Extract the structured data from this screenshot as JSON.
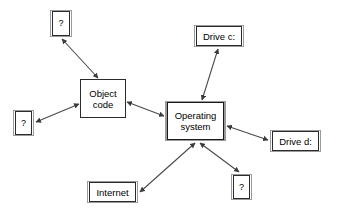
{
  "diagram": {
    "type": "concept-map",
    "background_color": "#ffffff",
    "line_color": "#4a4a4a",
    "box_border_color": "#2b2b2b",
    "box_frame_color": "#9b9b9b",
    "nodes": [
      {
        "id": "q_top",
        "label": "?",
        "style": "framed",
        "x": 50,
        "y": 10,
        "w": 22,
        "h": 27
      },
      {
        "id": "drive_c",
        "label": "Drive c:",
        "style": "framed",
        "x": 194,
        "y": 25,
        "w": 50,
        "h": 22
      },
      {
        "id": "object",
        "label": "Object\ncode",
        "style": "plain",
        "x": 80,
        "y": 79,
        "w": 46,
        "h": 39
      },
      {
        "id": "q_left",
        "label": "?",
        "style": "framed",
        "x": 13,
        "y": 110,
        "w": 21,
        "h": 26
      },
      {
        "id": "os",
        "label": "Operating\nsystem",
        "style": "hub",
        "x": 165,
        "y": 101,
        "w": 61,
        "h": 40
      },
      {
        "id": "drive_d",
        "label": "Drive d:",
        "style": "framed",
        "x": 270,
        "y": 130,
        "w": 51,
        "h": 22
      },
      {
        "id": "q_bottom",
        "label": "?",
        "style": "framed",
        "x": 231,
        "y": 174,
        "w": 21,
        "h": 26
      },
      {
        "id": "internet",
        "label": "Internet",
        "style": "framed",
        "x": 87,
        "y": 181,
        "w": 51,
        "h": 22
      }
    ],
    "edges": [
      {
        "from": "object",
        "to": "q_top",
        "arrows": "both",
        "x1": 98,
        "y1": 78,
        "x2": 62,
        "y2": 39
      },
      {
        "from": "object",
        "to": "q_left",
        "arrows": "both",
        "x1": 79,
        "y1": 104,
        "x2": 36,
        "y2": 122
      },
      {
        "from": "object",
        "to": "os",
        "arrows": "both",
        "x1": 127,
        "y1": 102,
        "x2": 164,
        "y2": 116
      },
      {
        "from": "os",
        "to": "drive_c",
        "arrows": "both",
        "x1": 202,
        "y1": 100,
        "x2": 218,
        "y2": 49
      },
      {
        "from": "os",
        "to": "drive_d",
        "arrows": "both",
        "x1": 227,
        "y1": 126,
        "x2": 268,
        "y2": 140
      },
      {
        "from": "os",
        "to": "q_bottom",
        "arrows": "both",
        "x1": 200,
        "y1": 143,
        "x2": 239,
        "y2": 172
      },
      {
        "from": "os",
        "to": "internet",
        "arrows": "both",
        "x1": 195,
        "y1": 143,
        "x2": 140,
        "y2": 192
      }
    ]
  }
}
